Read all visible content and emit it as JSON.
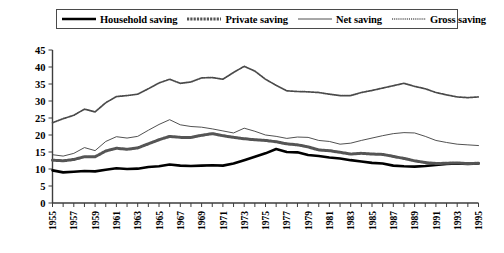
{
  "chart_data": {
    "type": "line",
    "title": "",
    "xlabel": "",
    "ylabel": "",
    "xlim": [
      1955,
      1995
    ],
    "ylim": [
      0,
      45
    ],
    "ytick_step": 5,
    "yticks": [
      0,
      5,
      10,
      15,
      20,
      25,
      30,
      35,
      40,
      45
    ],
    "ytick_labels": [
      "0",
      "5",
      "10",
      "15",
      "20",
      "25",
      "30",
      "35",
      "40",
      "45"
    ],
    "x": [
      1955,
      1956,
      1957,
      1958,
      1959,
      1960,
      1961,
      1962,
      1963,
      1964,
      1965,
      1966,
      1967,
      1968,
      1969,
      1970,
      1971,
      1972,
      1973,
      1974,
      1975,
      1976,
      1977,
      1978,
      1979,
      1980,
      1981,
      1982,
      1983,
      1984,
      1985,
      1986,
      1987,
      1988,
      1989,
      1990,
      1991,
      1992,
      1993,
      1994,
      1995
    ],
    "xtick_labels": [
      "1955",
      "1957",
      "1959",
      "1961",
      "1963",
      "1965",
      "1967",
      "1969",
      "1971",
      "1973",
      "1975",
      "1977",
      "1979",
      "1981",
      "1983",
      "1985",
      "1987",
      "1989",
      "1991",
      "1993",
      "1995"
    ],
    "xtick_values": [
      1955,
      1957,
      1959,
      1961,
      1963,
      1965,
      1967,
      1969,
      1971,
      1973,
      1975,
      1977,
      1979,
      1981,
      1983,
      1985,
      1987,
      1989,
      1991,
      1993,
      1995
    ],
    "grid": false,
    "legend_position": "top",
    "series": [
      {
        "name": "Household saving",
        "style": "solid-thick",
        "color": "#000000",
        "width": 2.6,
        "values": [
          9.6,
          9.0,
          9.2,
          9.4,
          9.3,
          9.8,
          10.2,
          10.0,
          10.1,
          10.6,
          10.8,
          11.3,
          11.0,
          10.9,
          11.0,
          11.1,
          11.0,
          11.6,
          12.6,
          13.6,
          14.6,
          15.9,
          15.0,
          14.9,
          14.1,
          13.8,
          13.4,
          13.1,
          12.6,
          12.2,
          11.8,
          11.6,
          11.0,
          10.8,
          10.7,
          10.9,
          11.2,
          11.5,
          11.6,
          11.5,
          11.6
        ]
      },
      {
        "name": "Private saving",
        "style": "thick-textured",
        "color": "#555555",
        "width": 3.0,
        "values": [
          12.6,
          12.4,
          12.8,
          13.6,
          13.6,
          15.3,
          16.1,
          15.8,
          16.2,
          17.4,
          18.6,
          19.6,
          19.3,
          19.3,
          19.9,
          20.4,
          19.8,
          19.3,
          18.9,
          18.6,
          18.4,
          18.0,
          17.4,
          17.1,
          16.5,
          15.6,
          15.4,
          14.9,
          14.4,
          14.6,
          14.4,
          14.3,
          13.7,
          13.1,
          12.4,
          11.9,
          11.6,
          11.7,
          11.8,
          11.6,
          11.7
        ]
      },
      {
        "name": "Net saving",
        "style": "thin-solid",
        "color": "#3d3d3d",
        "width": 0.9,
        "values": [
          14.2,
          13.8,
          14.6,
          16.3,
          15.4,
          18.1,
          19.5,
          19.1,
          19.6,
          21.4,
          23.1,
          24.5,
          23.0,
          22.5,
          22.3,
          21.8,
          21.2,
          20.6,
          22.0,
          21.1,
          20.0,
          19.6,
          19.0,
          19.4,
          19.3,
          18.4,
          18.1,
          17.3,
          17.6,
          18.4,
          19.1,
          19.8,
          20.4,
          20.7,
          20.6,
          19.6,
          18.4,
          17.8,
          17.3,
          17.1,
          16.9
        ]
      },
      {
        "name": "Gross saving",
        "style": "dotted-fine",
        "color": "#4a4a4a",
        "width": 1.2,
        "values": [
          23.6,
          24.8,
          25.8,
          27.6,
          26.8,
          29.5,
          31.3,
          31.6,
          32.0,
          33.6,
          35.3,
          36.4,
          35.2,
          35.6,
          36.8,
          36.9,
          36.4,
          38.4,
          40.2,
          38.8,
          36.4,
          34.6,
          33.0,
          32.8,
          32.7,
          32.5,
          32.0,
          31.6,
          31.6,
          32.5,
          33.1,
          33.8,
          34.5,
          35.2,
          34.3,
          33.6,
          32.5,
          31.8,
          31.2,
          31.0,
          31.2
        ]
      }
    ]
  },
  "legend": {
    "items": [
      {
        "label": "Household saving",
        "swatch": "solid-thick-swatch"
      },
      {
        "label": "Private saving",
        "swatch": "textured-swatch"
      },
      {
        "label": "Net saving",
        "swatch": "thin-solid-swatch"
      },
      {
        "label": "Gross saving",
        "swatch": "dotted-swatch"
      }
    ]
  }
}
